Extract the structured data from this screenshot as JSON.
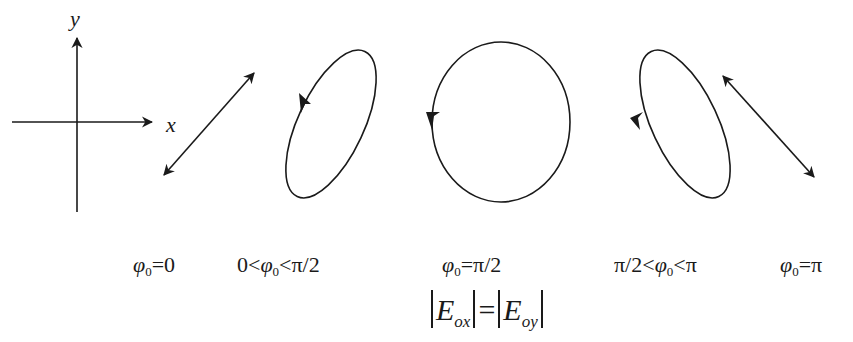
{
  "axes": {
    "x_label": "x",
    "y_label": "y"
  },
  "panels": [
    {
      "id": "phi0-zero",
      "shape": "linear-diagonal-up",
      "label_phi": "φ",
      "label_sub": "0",
      "label_rest": "=0",
      "prefix": ""
    },
    {
      "id": "phi0-between-0-and-pi-over-2",
      "shape": "ellipse-tilted-right",
      "prefix": "0<",
      "label_phi": "φ",
      "label_sub": "0",
      "label_rest": "<π/2"
    },
    {
      "id": "phi0-pi-over-2",
      "shape": "circle",
      "prefix": "",
      "label_phi": "φ",
      "label_sub": "0",
      "label_rest": "=π/2"
    },
    {
      "id": "phi0-between-pi-over-2-and-pi",
      "shape": "ellipse-tilted-left",
      "prefix": "π/2<",
      "label_phi": "φ",
      "label_sub": "0",
      "label_rest": "<π"
    },
    {
      "id": "phi0-pi",
      "shape": "linear-diagonal-down",
      "prefix": "",
      "label_phi": "φ",
      "label_sub": "0",
      "label_rest": "=π"
    }
  ],
  "formula": {
    "left_E": "E",
    "left_sub": "ox",
    "equals": "=",
    "right_E": "E",
    "right_sub": "oy"
  },
  "colors": {
    "stroke": "#1a1a1a",
    "background": "#ffffff"
  }
}
